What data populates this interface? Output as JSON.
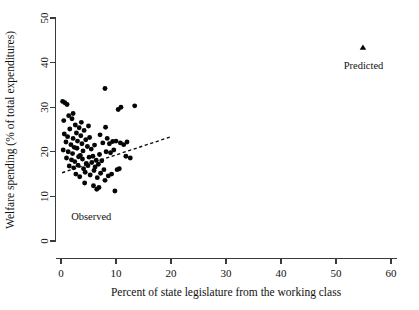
{
  "chart_data": {
    "type": "scatter",
    "title": "",
    "xlabel": "Percent of state legislature from the working class",
    "ylabel": "Welfare spending (% of total expenditures)",
    "xlim": [
      -1.5,
      62
    ],
    "ylim": [
      -1.5,
      52.5
    ],
    "xticks": [
      0,
      10,
      20,
      30,
      40,
      50,
      60
    ],
    "yticks": [
      0,
      10,
      20,
      30,
      40,
      50
    ],
    "xtick_labels": [
      "0",
      "10",
      "20",
      "30",
      "40",
      "50",
      "60"
    ],
    "ytick_labels": [
      "0",
      "10",
      "20",
      "30",
      "40",
      "50"
    ],
    "grid": false,
    "legend": "none",
    "series": [
      {
        "name": "Observed",
        "marker": "circle",
        "color": "#060606",
        "label_text": "Observed",
        "label_x": 5.5,
        "label_y": 4.6,
        "points": [
          [
            0.3,
            31.3
          ],
          [
            0.7,
            31.0
          ],
          [
            1.1,
            30.6
          ],
          [
            0.5,
            27.0
          ],
          [
            1.4,
            28.1
          ],
          [
            2.0,
            27.4
          ],
          [
            1.6,
            25.1
          ],
          [
            2.6,
            26.0
          ],
          [
            3.3,
            25.4
          ],
          [
            0.6,
            24.0
          ],
          [
            1.2,
            23.4
          ],
          [
            2.2,
            23.0
          ],
          [
            2.8,
            24.2
          ],
          [
            3.6,
            23.6
          ],
          [
            4.2,
            24.8
          ],
          [
            0.9,
            22.2
          ],
          [
            1.8,
            21.6
          ],
          [
            2.4,
            21.0
          ],
          [
            3.0,
            22.4
          ],
          [
            3.8,
            21.8
          ],
          [
            4.5,
            22.7
          ],
          [
            5.2,
            23.2
          ],
          [
            0.4,
            20.4
          ],
          [
            1.3,
            20.0
          ],
          [
            2.1,
            19.6
          ],
          [
            2.9,
            20.8
          ],
          [
            3.5,
            19.2
          ],
          [
            4.0,
            20.2
          ],
          [
            4.8,
            21.2
          ],
          [
            5.5,
            20.6
          ],
          [
            6.1,
            21.5
          ],
          [
            1.0,
            18.6
          ],
          [
            1.9,
            18.2
          ],
          [
            2.5,
            17.8
          ],
          [
            3.2,
            18.9
          ],
          [
            3.9,
            18.4
          ],
          [
            4.6,
            17.4
          ],
          [
            5.1,
            18.8
          ],
          [
            5.8,
            19.0
          ],
          [
            6.4,
            18.1
          ],
          [
            7.0,
            19.4
          ],
          [
            1.5,
            16.8
          ],
          [
            2.3,
            16.4
          ],
          [
            3.1,
            17.0
          ],
          [
            4.1,
            16.2
          ],
          [
            4.9,
            16.9
          ],
          [
            5.6,
            17.6
          ],
          [
            6.2,
            16.6
          ],
          [
            6.8,
            17.2
          ],
          [
            7.4,
            18.0
          ],
          [
            2.7,
            15.0
          ],
          [
            3.4,
            14.4
          ],
          [
            4.4,
            15.4
          ],
          [
            5.3,
            14.8
          ],
          [
            6.0,
            15.8
          ],
          [
            6.6,
            14.2
          ],
          [
            7.2,
            15.2
          ],
          [
            7.8,
            16.0
          ],
          [
            4.3,
            13.0
          ],
          [
            5.9,
            12.4
          ],
          [
            6.5,
            11.6
          ],
          [
            6.9,
            12.0
          ],
          [
            8.0,
            13.6
          ],
          [
            8.6,
            14.6
          ],
          [
            9.2,
            15.0
          ],
          [
            9.8,
            11.2
          ],
          [
            10.2,
            16.0
          ],
          [
            10.6,
            16.2
          ],
          [
            8.2,
            20.0
          ],
          [
            8.8,
            21.8
          ],
          [
            9.4,
            22.3
          ],
          [
            7.6,
            22.0
          ],
          [
            8.4,
            23.0
          ],
          [
            9.0,
            19.8
          ],
          [
            9.6,
            20.4
          ],
          [
            10.0,
            22.4
          ],
          [
            10.8,
            22.0
          ],
          [
            11.4,
            21.6
          ],
          [
            12.0,
            22.2
          ],
          [
            8.1,
            25.5
          ],
          [
            10.4,
            29.5
          ],
          [
            10.9,
            30.0
          ],
          [
            13.4,
            30.3
          ],
          [
            8.0,
            34.2
          ],
          [
            11.8,
            19.0
          ],
          [
            12.6,
            18.6
          ],
          [
            7.1,
            23.8
          ],
          [
            5.0,
            25.8
          ],
          [
            3.7,
            26.6
          ],
          [
            2.2,
            28.6
          ]
        ]
      },
      {
        "name": "Predicted",
        "marker": "triangle",
        "color": "#060606",
        "label_text": "Predicted",
        "label_x": 55.0,
        "label_y": 38.5,
        "points": [
          [
            54.9,
            43.4
          ]
        ]
      }
    ],
    "fit_line": {
      "name": "regression-fit",
      "style": "dashed",
      "color": "#0a0a0a",
      "x_start": 0.2,
      "y_start": 15.3,
      "x_end": 19.8,
      "y_end": 23.3
    }
  }
}
